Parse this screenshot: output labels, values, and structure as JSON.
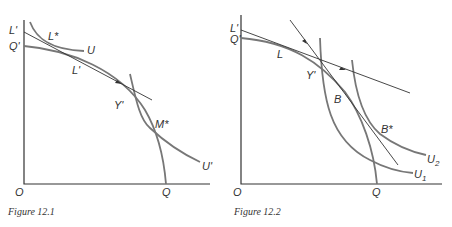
{
  "figures": [
    {
      "caption": "Figure 12.1",
      "labels": {
        "origin": "O",
        "x_intercept": "Q",
        "y_top": "L'",
        "y_q": "Q'",
        "l_star": "L*",
        "u": "U",
        "l_prime": "L'",
        "y_prime": "Y'",
        "m_star": "M*",
        "u_prime": "U'"
      }
    },
    {
      "caption": "Figure 12.2",
      "labels": {
        "origin": "O",
        "x_intercept": "Q",
        "y_top": "L'",
        "y_q": "Q'",
        "l": "L",
        "y_prime": "Y'",
        "b": "B",
        "b_star": "B*",
        "u2": "U",
        "u2_sub": "2",
        "u1": "U",
        "u1_sub": "1"
      }
    }
  ]
}
